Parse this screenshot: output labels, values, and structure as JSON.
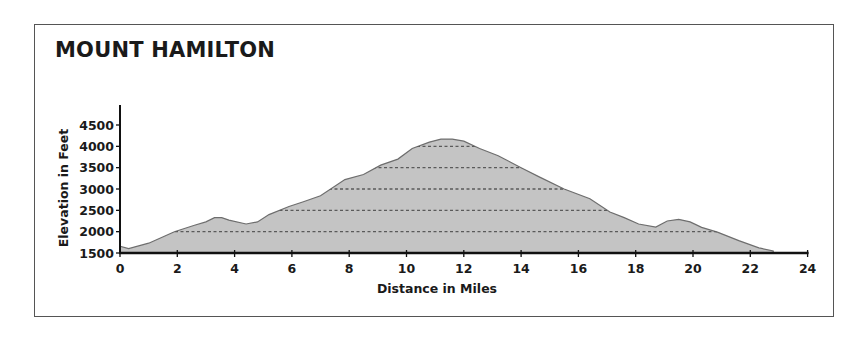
{
  "title": "MOUNT HAMILTON",
  "colors": {
    "fill": "#c4c4c4",
    "stroke": "#6e6e6e",
    "gridline": "#5a5a5a",
    "axis": "#111111",
    "frame": "#555555"
  },
  "chart_data": {
    "type": "area",
    "title": "MOUNT HAMILTON",
    "xlabel": "Distance in Miles",
    "ylabel": "Elevation in Feet",
    "xlim": [
      0,
      24
    ],
    "ylim": [
      1500,
      4800
    ],
    "xticks": [
      0,
      2,
      4,
      6,
      8,
      10,
      12,
      14,
      16,
      18,
      20,
      22,
      24
    ],
    "yticks": [
      1500,
      2000,
      2500,
      3000,
      3500,
      4000,
      4500
    ],
    "grid": "dashed horizontal lines inside filled area at 2000, 2500, 3000, 3500, 4000",
    "legend": null,
    "series": [
      {
        "name": "Elevation profile",
        "x": [
          0,
          0.3,
          1.0,
          1.9,
          2.6,
          3.0,
          3.3,
          3.55,
          3.8,
          4.4,
          4.8,
          5.2,
          5.9,
          6.4,
          7.0,
          7.85,
          8.5,
          9.1,
          9.7,
          10.2,
          10.8,
          11.2,
          11.6,
          12.0,
          12.55,
          13.2,
          14.0,
          14.65,
          15.5,
          16.4,
          17.1,
          17.6,
          18.1,
          18.7,
          19.1,
          19.5,
          19.9,
          20.3,
          20.85,
          21.6,
          22.3,
          22.8
        ],
        "values": [
          1660,
          1600,
          1730,
          2000,
          2150,
          2230,
          2330,
          2330,
          2270,
          2180,
          2230,
          2400,
          2590,
          2700,
          2840,
          3220,
          3340,
          3560,
          3700,
          3950,
          4100,
          4170,
          4170,
          4120,
          3950,
          3780,
          3500,
          3280,
          3000,
          2770,
          2460,
          2330,
          2180,
          2110,
          2250,
          2290,
          2230,
          2100,
          1990,
          1790,
          1620,
          1550
        ]
      }
    ]
  }
}
